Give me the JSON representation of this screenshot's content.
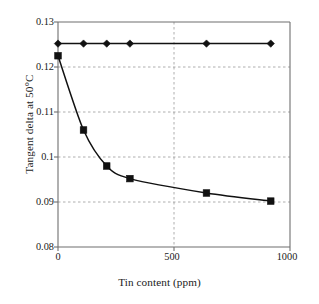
{
  "chart_data": {
    "type": "line",
    "title": "",
    "xlabel": "Tin content (ppm)",
    "ylabel": "Tangent delta at 50°C",
    "xlim": [
      0,
      1000
    ],
    "ylim": [
      0.08,
      0.13
    ],
    "xticks": [
      "0",
      "500",
      "1000"
    ],
    "xtick_values": [
      0,
      500,
      1000
    ],
    "yticks": [
      "0.08",
      "0.09",
      "0.1",
      "0.11",
      "0.12",
      "0.13"
    ],
    "ytick_values": [
      0.08,
      0.09,
      0.1,
      0.11,
      0.12,
      0.13
    ],
    "grid": "horizontal-and-vertical-dashed",
    "legend": "none",
    "series": [
      {
        "name": "series-diamond",
        "marker": "diamond",
        "color": "#111111",
        "x": [
          0,
          110,
          210,
          310,
          640,
          917
        ],
        "values": [
          0.1252,
          0.1252,
          0.1252,
          0.1252,
          0.1252,
          0.1252
        ]
      },
      {
        "name": "series-square",
        "marker": "square",
        "color": "#111111",
        "x": [
          0,
          110,
          210,
          310,
          640,
          917
        ],
        "values": [
          0.1225,
          0.106,
          0.098,
          0.0952,
          0.092,
          0.0902
        ]
      }
    ]
  },
  "axis": {
    "y_title": "Tangent delta at 50°C",
    "x_title": "Tin content (ppm)"
  },
  "colors": {
    "background": "#ffffff",
    "axis": "#6f6f6f",
    "grid": "#9a9a9a",
    "data": "#111111",
    "text": "#1a1a1a"
  }
}
